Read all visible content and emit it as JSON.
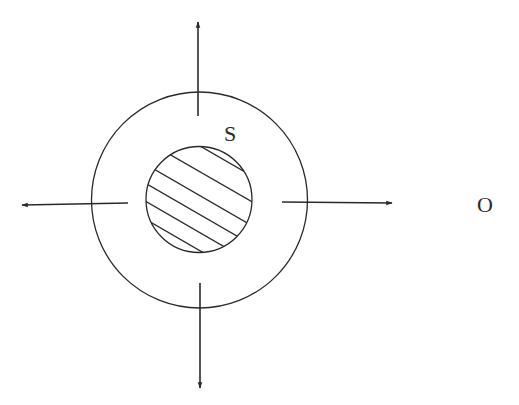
{
  "diagram": {
    "labels": {
      "shell": "S",
      "observer": "O"
    },
    "colors": {
      "stroke": "#2a2a2a",
      "background": "#ffffff"
    },
    "outer_circle": {
      "cx": 199.5,
      "cy": 200,
      "r": 108
    },
    "inner_circle": {
      "cx": 199,
      "cy": 199.5,
      "r": 53,
      "fill": "hatched"
    },
    "arrows": [
      {
        "direction": "up",
        "from": [
          198,
          116
        ],
        "to": [
          198,
          22
        ]
      },
      {
        "direction": "down",
        "from": [
          200,
          283
        ],
        "to": [
          200,
          388
        ]
      },
      {
        "direction": "left",
        "from": [
          128,
          203
        ],
        "to": [
          22,
          205
        ]
      },
      {
        "direction": "right",
        "from": [
          282,
          202
        ],
        "to": [
          392,
          203
        ]
      }
    ]
  }
}
